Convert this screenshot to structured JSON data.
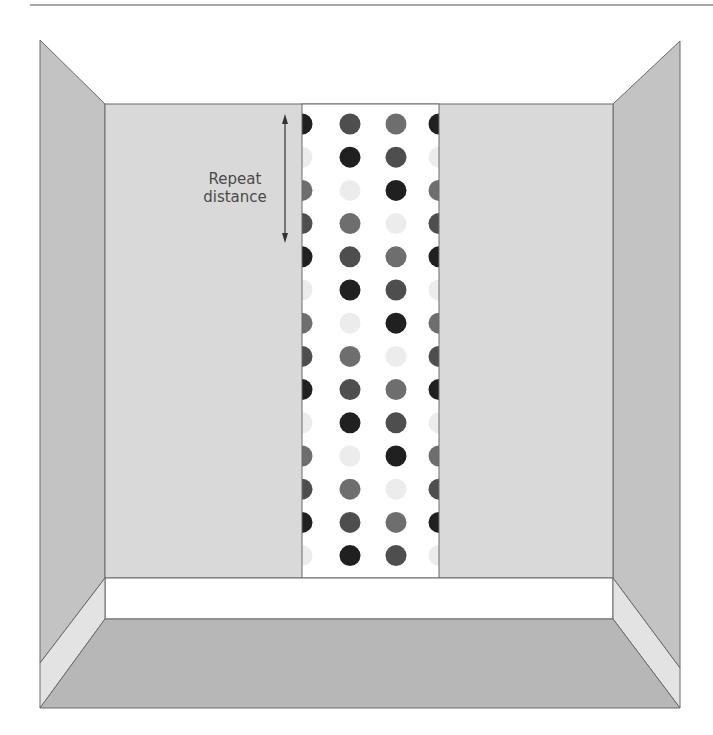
{
  "figure": {
    "annotation": {
      "line1": "Repeat",
      "line2": "distance"
    },
    "colors": {
      "side_wall": "#c3c3c3",
      "back_wall": "#d9d9d9",
      "floor": "#b7b7b7",
      "baseboard": "#ffffff",
      "baseboard_side": "#e3e3e3",
      "wallpaper_bg": "#ffffff",
      "edge": "#6a6a6a",
      "top_rule": "#8a8a8a"
    },
    "wallpaper": {
      "x_left": 302,
      "x_right": 439,
      "y_top": 104,
      "y_bottom": 578,
      "columns_x": [
        302,
        350,
        396,
        439
      ],
      "row_start_y": 124,
      "row_spacing": 33.2,
      "rows": 14,
      "dot_radius": 10.5,
      "palette": [
        "#202020",
        "#ececec",
        "#6e6e6e",
        "#4e4e4e"
      ],
      "column_phase": [
        0,
        3,
        2,
        0
      ],
      "phase_note": "color index per row = (row + phase) mod 4"
    }
  }
}
